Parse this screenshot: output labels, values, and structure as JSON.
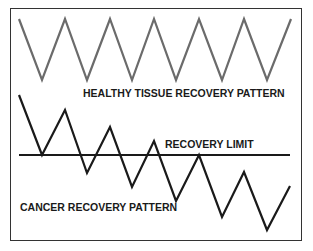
{
  "diagram": {
    "labels": {
      "healthy": "HEALTHY TISSUE RECOVERY PATTERN",
      "limit": "RECOVERY LIMIT",
      "cancer": "CANCER RECOVERY PATTERN"
    },
    "colors": {
      "healthy_line": "#6b6b6b",
      "cancer_line": "#1a1a1a",
      "limit_line": "#1a1a1a",
      "border": "#333333"
    },
    "series": {
      "healthy_points": "19,19 42,80 65,19 87,80 110,19 132,80 154,19 176,80 199,19 222,80 244,19 267,80 291,19",
      "cancer_points": "19,95 42,155 65,110 87,173 110,127 132,187 154,141 176,201 199,155 222,217 244,172 267,230 290,186",
      "limit_line": {
        "x1": 19,
        "x2": 290,
        "y": 155
      }
    }
  }
}
